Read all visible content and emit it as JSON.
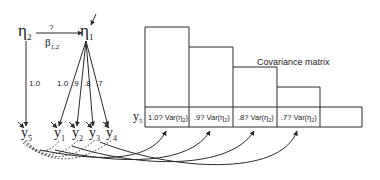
{
  "diagram": {
    "latent": {
      "eta2": {
        "symbol": "η",
        "sub": "2"
      },
      "eta1": {
        "symbol": "η",
        "sub": "1"
      }
    },
    "path": {
      "question": "?",
      "beta_symbol": "β",
      "beta_sub": "1,2"
    },
    "loadings": {
      "eta2_y5": "1.0",
      "eta1_y1": "1.0",
      "eta1_y2": ".9",
      "eta1_y3": ".8",
      "eta1_y4": ".7"
    },
    "indicators": [
      {
        "symbol": "y",
        "sub": "5"
      },
      {
        "symbol": "y",
        "sub": "1"
      },
      {
        "symbol": "y",
        "sub": "2"
      },
      {
        "symbol": "y",
        "sub": "3"
      },
      {
        "symbol": "y",
        "sub": "4"
      }
    ]
  },
  "matrix": {
    "title": "Covariance matrix",
    "row_label": {
      "symbol": "y",
      "sub": "5"
    },
    "cells": [
      {
        "coef": "1.0? Var(η",
        "sub": "2",
        "close": ")"
      },
      {
        "coef": ".9? Var(η",
        "sub": "2",
        "close": ")"
      },
      {
        "coef": ".8? Var(η",
        "sub": "2",
        "close": ")"
      },
      {
        "coef": ".7? Var(η",
        "sub": "2",
        "close": ")"
      },
      {
        "coef": "",
        "sub": "",
        "close": ""
      }
    ]
  },
  "colors": {
    "line": "#2a2a2a",
    "background": "#ffffff"
  }
}
